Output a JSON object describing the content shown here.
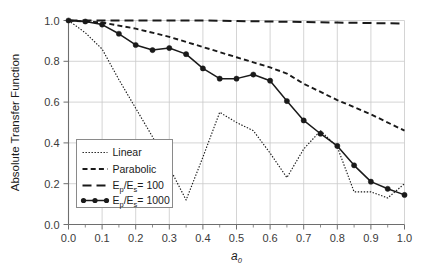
{
  "chart_data": {
    "type": "line",
    "title": "",
    "xlabel": "a0",
    "xlabel_base": "a",
    "xlabel_sub": "0",
    "ylabel": "Absolute Transfer Function",
    "xlim": [
      0.0,
      1.0
    ],
    "ylim": [
      0.0,
      1.0
    ],
    "xticks": [
      "0.0",
      "0.1",
      "0.2",
      "0.3",
      "0.4",
      "0.5",
      "0.6",
      "0.7",
      "0.8",
      "0.9",
      "1.0"
    ],
    "xtick_values": [
      0.0,
      0.1,
      0.2,
      0.3,
      0.4,
      0.5,
      0.6,
      0.7,
      0.8,
      0.9,
      1.0
    ],
    "yticks": [
      "0.0",
      "0.2",
      "0.4",
      "0.6",
      "0.8",
      "1.0"
    ],
    "ytick_values": [
      0.0,
      0.2,
      0.4,
      0.6,
      0.8,
      1.0
    ],
    "grid": true,
    "grid_color": "#c9c9c9",
    "legend_position": "lower-left",
    "frame_color": "#6e6e6e",
    "series": [
      {
        "name": "Linear",
        "legend_label": "Linear",
        "style": "dotted",
        "color": "#1a1a1a",
        "marker": "none",
        "x": [
          0.0,
          0.05,
          0.1,
          0.15,
          0.2,
          0.25,
          0.3,
          0.35,
          0.4,
          0.45,
          0.5,
          0.55,
          0.6,
          0.65,
          0.7,
          0.75,
          0.8,
          0.85,
          0.9,
          0.95,
          1.0
        ],
        "y": [
          1.0,
          0.94,
          0.86,
          0.71,
          0.57,
          0.43,
          0.28,
          0.12,
          0.33,
          0.55,
          0.5,
          0.46,
          0.35,
          0.23,
          0.37,
          0.46,
          0.38,
          0.16,
          0.16,
          0.13,
          0.2
        ]
      },
      {
        "name": "Parabolic",
        "legend_label": "Parabolic",
        "style": "dashed-short",
        "color": "#1a1a1a",
        "marker": "none",
        "x": [
          0.0,
          0.1,
          0.2,
          0.3,
          0.4,
          0.5,
          0.6,
          0.65,
          0.7,
          0.8,
          0.9,
          1.0
        ],
        "y": [
          1.0,
          0.99,
          0.96,
          0.92,
          0.87,
          0.82,
          0.77,
          0.74,
          0.69,
          0.61,
          0.54,
          0.46
        ]
      },
      {
        "name": "Ep/Es = 100",
        "legend_label_base": "E",
        "legend_label_sub1": "p",
        "legend_label_mid": "/E",
        "legend_label_sub2": "s",
        "legend_label_tail": "= 100",
        "style": "dashed-long",
        "color": "#1a1a1a",
        "marker": "none",
        "x": [
          0.0,
          0.2,
          0.4,
          0.6,
          0.8,
          1.0
        ],
        "y": [
          1.0,
          1.0,
          1.0,
          0.995,
          0.99,
          0.985
        ]
      },
      {
        "name": "Ep/Es = 1000",
        "legend_label_base": "E",
        "legend_label_sub1": "p",
        "legend_label_mid": "/E",
        "legend_label_sub2": "s",
        "legend_label_tail": "= 1000",
        "style": "solid",
        "color": "#1a1a1a",
        "marker": "circle",
        "x": [
          0.0,
          0.05,
          0.1,
          0.15,
          0.2,
          0.25,
          0.3,
          0.35,
          0.4,
          0.45,
          0.5,
          0.55,
          0.6,
          0.65,
          0.7,
          0.75,
          0.8,
          0.85,
          0.9,
          0.95,
          1.0
        ],
        "y": [
          1.0,
          0.995,
          0.98,
          0.935,
          0.88,
          0.855,
          0.865,
          0.835,
          0.765,
          0.715,
          0.715,
          0.735,
          0.705,
          0.605,
          0.51,
          0.445,
          0.385,
          0.29,
          0.21,
          0.175,
          0.145
        ]
      }
    ]
  }
}
